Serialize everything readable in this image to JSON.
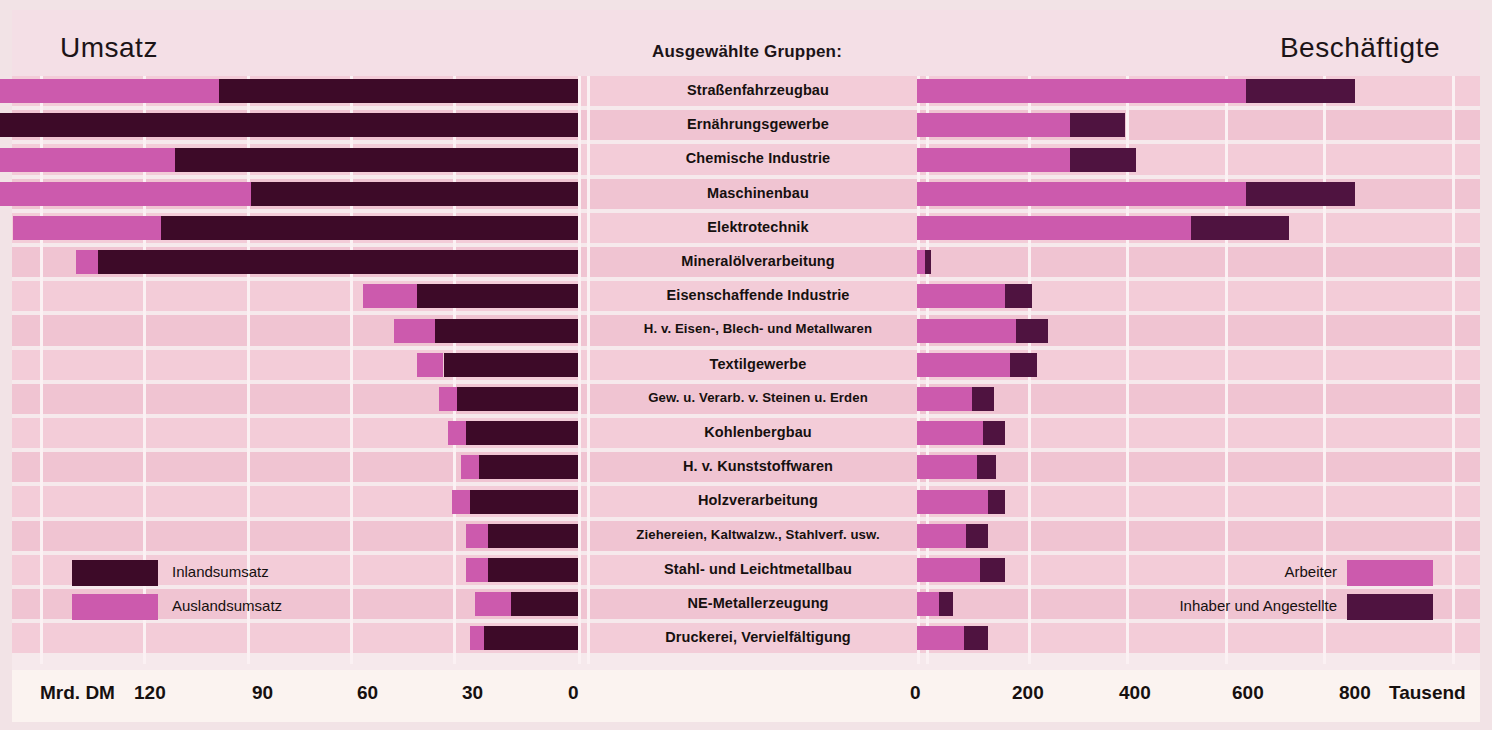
{
  "header": {
    "left_title": "Umsatz",
    "center_title": "Ausgewählte Gruppen:",
    "right_title": "Beschäftigte"
  },
  "colors": {
    "page_background": "#f2e3e6",
    "panel_background": "#f4dfe6",
    "row_light": "#f3ccd8",
    "row_alt": "#f0c4d2",
    "separator": "#fbf1f3",
    "axis_band": "#fbf3f0",
    "series_auslandsumsatz": "#cc5aad",
    "series_inlandsumsatz": "#3d0a28",
    "series_arbeiter": "#cc5aad",
    "series_inhaber_angestellte": "#4f1340",
    "text": "#16100f"
  },
  "legend": {
    "left": [
      {
        "label": "Inlandsumsatz",
        "color": "#3d0a28",
        "swatch_side": "left"
      },
      {
        "label": "Auslandsumsatz",
        "color": "#cc5aad",
        "swatch_side": "left"
      }
    ],
    "right": [
      {
        "label": "Arbeiter",
        "color": "#cc5aad",
        "swatch_side": "right"
      },
      {
        "label": "Inhaber und Angestellte",
        "color": "#4f1340",
        "swatch_side": "right"
      }
    ]
  },
  "axis": {
    "left_unit": "Mrd. DM",
    "left_ticks": [
      120,
      90,
      60,
      30,
      0
    ],
    "right_ticks": [
      0,
      200,
      400,
      600,
      800
    ],
    "right_unit": "Tausend"
  },
  "chart_data": {
    "type": "bar",
    "subtitle": "Ausgewählte Gruppen:",
    "orientation": "horizontal",
    "layout": "bidirectional-stacked (butterfly / tornado)",
    "grid": true,
    "legend_position": "inside-left-and-right",
    "left_panel": {
      "name": "Umsatz",
      "xlabel": "Mrd. DM",
      "direction": "right-to-left",
      "xlim": [
        0,
        120
      ],
      "ticks": [
        120,
        90,
        60,
        30,
        0
      ],
      "series": [
        {
          "name": "Auslandsumsatz",
          "color": "#cc5aad"
        },
        {
          "name": "Inlandsumsatz",
          "color": "#3d0a28"
        }
      ]
    },
    "right_panel": {
      "name": "Beschäftigte",
      "xlabel": "Tausend",
      "direction": "left-to-right",
      "xlim": [
        0,
        850
      ],
      "ticks": [
        0,
        200,
        400,
        600,
        800
      ],
      "series": [
        {
          "name": "Arbeiter",
          "color": "#cc5aad"
        },
        {
          "name": "Inhaber und Angestellte",
          "color": "#4f1340"
        }
      ]
    },
    "categories": [
      "Straßenfahrzeugbau",
      "Ernährungsgewerbe",
      "Chemische Industrie",
      "Maschinenbau",
      "Elektrotechnik",
      "Mineralölverarbeitung",
      "Eisenschaffende Industrie",
      "H. v. Eisen-, Blech- und Metallwaren",
      "Textilgewerbe",
      "Gew. u. Verarb. v. Steinen u. Erden",
      "Kohlenbergbau",
      "H. v. Kunststoffwaren",
      "Holzverarbeitung",
      "Ziehereien, Kaltwalzw., Stahlverf. usw.",
      "Stahl- und Leichtmetallbau",
      "NE-Metallerzeugung",
      "Druckerei, Vervielfältigung"
    ],
    "rows": [
      {
        "category": "Straßenfahrzeugbau",
        "auslandsumsatz": 76,
        "inlandsumsatz": 80,
        "umsatz_total": 156,
        "arbeiter": 600,
        "inhaber_angestellte": 200,
        "beschaeftigte_total": 800
      },
      {
        "category": "Ernährungsgewerbe",
        "auslandsumsatz": 15,
        "inlandsumsatz": 142,
        "umsatz_total": 157,
        "arbeiter": 280,
        "inhaber_angestellte": 100,
        "beschaeftigte_total": 380
      },
      {
        "category": "Chemische Industrie",
        "auslandsumsatz": 58,
        "inlandsumsatz": 90,
        "umsatz_total": 148,
        "arbeiter": 280,
        "inhaber_angestellte": 120,
        "beschaeftigte_total": 400
      },
      {
        "category": "Maschinenbau",
        "auslandsumsatz": 65,
        "inlandsumsatz": 73,
        "umsatz_total": 138,
        "arbeiter": 600,
        "inhaber_angestellte": 200,
        "beschaeftigte_total": 800
      },
      {
        "category": "Elektrotechnik",
        "auslandsumsatz": 33,
        "inlandsumsatz": 93,
        "umsatz_total": 126,
        "arbeiter": 500,
        "inhaber_angestellte": 180,
        "beschaeftigte_total": 680
      },
      {
        "category": "Mineralölverarbeitung",
        "auslandsumsatz": 5,
        "inlandsumsatz": 107,
        "umsatz_total": 112,
        "arbeiter": 15,
        "inhaber_angestellte": 10,
        "beschaeftigte_total": 25
      },
      {
        "category": "Eisenschaffende Industrie",
        "auslandsumsatz": 12,
        "inlandsumsatz": 36,
        "umsatz_total": 48,
        "arbeiter": 160,
        "inhaber_angestellte": 50,
        "beschaeftigte_total": 210
      },
      {
        "category": "H. v. Eisen-, Blech- und Metallwaren",
        "auslandsumsatz": 9,
        "inlandsumsatz": 32,
        "umsatz_total": 41,
        "arbeiter": 180,
        "inhaber_angestellte": 60,
        "beschaeftigte_total": 240
      },
      {
        "category": "Textilgewerbe",
        "auslandsumsatz": 6,
        "inlandsumsatz": 30,
        "umsatz_total": 36,
        "arbeiter": 170,
        "inhaber_angestellte": 50,
        "beschaeftigte_total": 220
      },
      {
        "category": "Gew. u. Verarb. v. Steinen u. Erden",
        "auslandsumsatz": 4,
        "inlandsumsatz": 27,
        "umsatz_total": 31,
        "arbeiter": 100,
        "inhaber_angestellte": 40,
        "beschaeftigte_total": 140
      },
      {
        "category": "Kohlenbergbau",
        "auslandsumsatz": 4,
        "inlandsumsatz": 25,
        "umsatz_total": 29,
        "arbeiter": 120,
        "inhaber_angestellte": 40,
        "beschaeftigte_total": 160
      },
      {
        "category": "H. v. Kunststoffwaren",
        "auslandsumsatz": 4,
        "inlandsumsatz": 22,
        "umsatz_total": 26,
        "arbeiter": 110,
        "inhaber_angestellte": 35,
        "beschaeftigte_total": 145
      },
      {
        "category": "Holzverarbeitung",
        "auslandsumsatz": 4,
        "inlandsumsatz": 24,
        "umsatz_total": 28,
        "arbeiter": 130,
        "inhaber_angestellte": 30,
        "beschaeftigte_total": 160
      },
      {
        "category": "Ziehereien, Kaltwalzw., Stahlverf. usw.",
        "auslandsumsatz": 5,
        "inlandsumsatz": 20,
        "umsatz_total": 25,
        "arbeiter": 90,
        "inhaber_angestellte": 40,
        "beschaeftigte_total": 130
      },
      {
        "category": "Stahl- und Leichtmetallbau",
        "auslandsumsatz": 5,
        "inlandsumsatz": 20,
        "umsatz_total": 25,
        "arbeiter": 115,
        "inhaber_angestellte": 45,
        "beschaeftigte_total": 160
      },
      {
        "category": "NE-Metallerzeugung",
        "auslandsumsatz": 8,
        "inlandsumsatz": 15,
        "umsatz_total": 23,
        "arbeiter": 40,
        "inhaber_angestellte": 25,
        "beschaeftigte_total": 65
      },
      {
        "category": "Druckerei, Vervielfältigung",
        "auslandsumsatz": 3,
        "inlandsumsatz": 21,
        "umsatz_total": 24,
        "arbeiter": 85,
        "inhaber_angestellte": 45,
        "beschaeftigte_total": 130
      }
    ]
  }
}
